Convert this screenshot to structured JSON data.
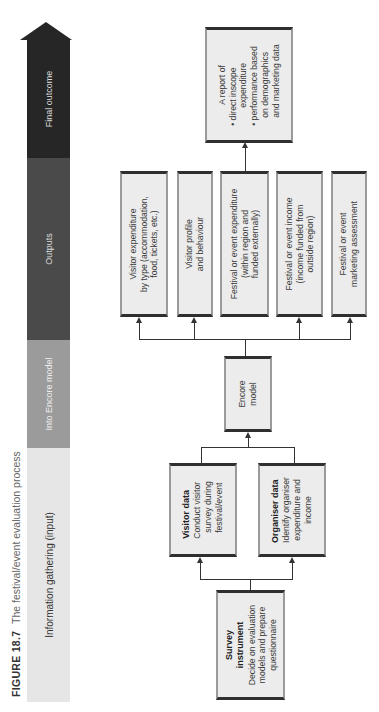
{
  "caption": {
    "figure_label": "FIGURE 18.7",
    "title": "The festival/event evaluation process"
  },
  "stages": [
    {
      "label": "Information gathering (input)",
      "color": "#e6e6e6",
      "text_color": "#333333"
    },
    {
      "label": "Into Encore model",
      "color": "#9b9b9b",
      "text_color": "#eeeeee"
    },
    {
      "label": "Outputs",
      "color": "#4a4a4a",
      "text_color": "#dddddd"
    },
    {
      "label": "Final outcome",
      "color": "#262626",
      "text_color": "#dddddd"
    }
  ],
  "nodes": {
    "survey": {
      "title": "Survey instrument",
      "title_line1": "Survey",
      "title_line2": "instrument",
      "lines": [
        "Decide on evaluation",
        "models and prepare",
        "questionnaire"
      ]
    },
    "visitor_data": {
      "title": "Visitor data",
      "lines": [
        "Conduct visitor",
        "survey during",
        "festival/event"
      ]
    },
    "organiser_data": {
      "title": "Organiser data",
      "lines": [
        "Identify organiser",
        "expenditure and",
        "income"
      ]
    },
    "encore": {
      "lines": [
        "Encore",
        "model"
      ]
    },
    "outputs": [
      {
        "lines": [
          "Visitor expenditure",
          "by type (accommodation,",
          "food, tickets, etc.)"
        ]
      },
      {
        "lines": [
          "Visitor profile",
          "and behaviour"
        ]
      },
      {
        "lines": [
          "Festival or event expenditure",
          "(within region and",
          "funded externally)"
        ]
      },
      {
        "lines": [
          "Festival or event income",
          "(income funded from",
          "outside region)"
        ]
      },
      {
        "lines": [
          "Festival or event",
          "marketing assessment"
        ]
      }
    ],
    "report": {
      "heading": "A report of",
      "bullets": [
        {
          "lines": [
            "direct inscope",
            "expenditure"
          ]
        },
        {
          "lines": [
            "performance based",
            "on demographics",
            "and marketing data"
          ]
        }
      ]
    }
  },
  "edges": [
    {
      "from": "survey",
      "to": "visitor_data"
    },
    {
      "from": "survey",
      "to": "organiser_data"
    },
    {
      "from": "visitor_data",
      "to": "encore"
    },
    {
      "from": "organiser_data",
      "to": "encore"
    },
    {
      "from": "encore",
      "to": "outputs"
    },
    {
      "from": "outputs",
      "to": "report"
    }
  ]
}
